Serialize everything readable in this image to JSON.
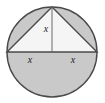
{
  "figure": {
    "kind": "geometry-diagram",
    "canvas": {
      "width": 105,
      "height": 103,
      "background": "#ffffff"
    },
    "colors": {
      "stroke": "#4a4a4a",
      "shade": "#c9c9c9",
      "unshaded": "#f5f5f5",
      "label": "#222222"
    },
    "circle": {
      "center_x": 52,
      "center_y": 52,
      "radius": 45,
      "top_y": 7,
      "bottom_y": 97,
      "left_x": 7,
      "right_x": 97
    },
    "triangle": {
      "apex": {
        "x": 52,
        "y": 7
      },
      "base_left": {
        "x": 7,
        "y": 52
      },
      "base_right": {
        "x": 97,
        "y": 52
      },
      "filled": false
    },
    "altitude": {
      "from": {
        "x": 52,
        "y": 7
      },
      "to": {
        "x": 52,
        "y": 52
      }
    },
    "shaded_regions": [
      "lower-semicircle",
      "upper-left-segment",
      "upper-right-segment"
    ],
    "labels": [
      {
        "id": "altitude-label",
        "text": "x",
        "x": 46,
        "y": 30
      },
      {
        "id": "base-left-label",
        "text": "x",
        "x": 30,
        "y": 61
      },
      {
        "id": "base-right-label",
        "text": "x",
        "x": 73,
        "y": 61
      }
    ]
  }
}
